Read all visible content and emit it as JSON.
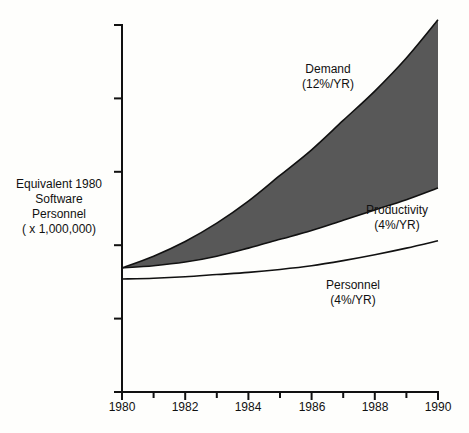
{
  "chart_data": {
    "type": "area",
    "title": "",
    "xlabel": "",
    "ylabel": [
      "Equivalent 1980",
      "Software",
      "Personnel",
      "( x 1,000,000)"
    ],
    "x": [
      1980,
      1981,
      1982,
      1983,
      1984,
      1985,
      1986,
      1987,
      1988,
      1989,
      1990
    ],
    "xticks": [
      "1980",
      "1982",
      "1984",
      "1986",
      "1988",
      "1990"
    ],
    "xlim": [
      1980,
      1990
    ],
    "ylim": [
      0,
      5
    ],
    "yticks_unlabeled": [
      0,
      1,
      2,
      3,
      4,
      5
    ],
    "grid": false,
    "legend": "none (inline annotations)",
    "series": [
      {
        "name": "Demand",
        "label": "(12%/YR)",
        "values": [
          1.69,
          1.85,
          2.05,
          2.3,
          2.6,
          2.95,
          3.3,
          3.7,
          4.1,
          4.55,
          5.07
        ]
      },
      {
        "name": "Productivity",
        "label": "(4%/YR)",
        "values": [
          1.69,
          1.72,
          1.77,
          1.85,
          1.96,
          2.08,
          2.2,
          2.34,
          2.48,
          2.62,
          2.78
        ]
      },
      {
        "name": "Personnel",
        "label": "(4%/YR)",
        "values": [
          1.54,
          1.55,
          1.57,
          1.6,
          1.63,
          1.67,
          1.72,
          1.79,
          1.87,
          1.96,
          2.06
        ]
      }
    ],
    "shaded_region": {
      "between": [
        "Demand",
        "Productivity"
      ],
      "color": "#555555"
    }
  },
  "labels": {
    "ylabel_lines": [
      "Equivalent 1980",
      "Software",
      "Personnel",
      "( x 1,000,000)"
    ],
    "demand": [
      "Demand",
      "(12%/YR)"
    ],
    "productivity": [
      "Productivity",
      "(4%/YR)"
    ],
    "personnel": [
      "Personnel",
      "(4%/YR)"
    ],
    "xticks": [
      "1980",
      "1982",
      "1984",
      "1986",
      "1988",
      "1990"
    ]
  },
  "colors": {
    "shade": "#585858",
    "line": "#111111",
    "background": "#fefefc"
  }
}
